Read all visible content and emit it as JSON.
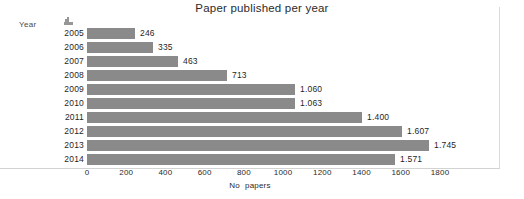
{
  "chart_data": {
    "type": "bar",
    "orientation": "horizontal",
    "title": "Paper published per year",
    "xlabel": "No  papers",
    "ylabel": "Year",
    "categories": [
      "2005",
      "2006",
      "2007",
      "2008",
      "2009",
      "2010",
      "2011",
      "2012",
      "2013",
      "2014"
    ],
    "values": [
      246,
      335,
      463,
      713,
      1060,
      1063,
      1400,
      1607,
      1745,
      1571
    ],
    "value_labels": [
      "246",
      "335",
      "463",
      "713",
      "1.060",
      "1.063",
      "1.400",
      "1.607",
      "1.745",
      "1.571"
    ],
    "xlim": [
      0,
      1800
    ],
    "xticks": [
      0,
      200,
      400,
      600,
      800,
      1000,
      1200,
      1400,
      1600,
      1800
    ],
    "xtick_labels": [
      "0",
      "200",
      "400",
      "600",
      "800",
      "1000",
      "1200",
      "1400",
      "1600",
      "1800"
    ],
    "grid": false,
    "legend": false,
    "bar_color": "#8a8a8a",
    "background_color": "#ffffff",
    "text_color": "#1f1f1f"
  },
  "axis": {
    "year_caption": "Year",
    "x_title_part1": "No",
    "x_title_part2": "papers"
  }
}
